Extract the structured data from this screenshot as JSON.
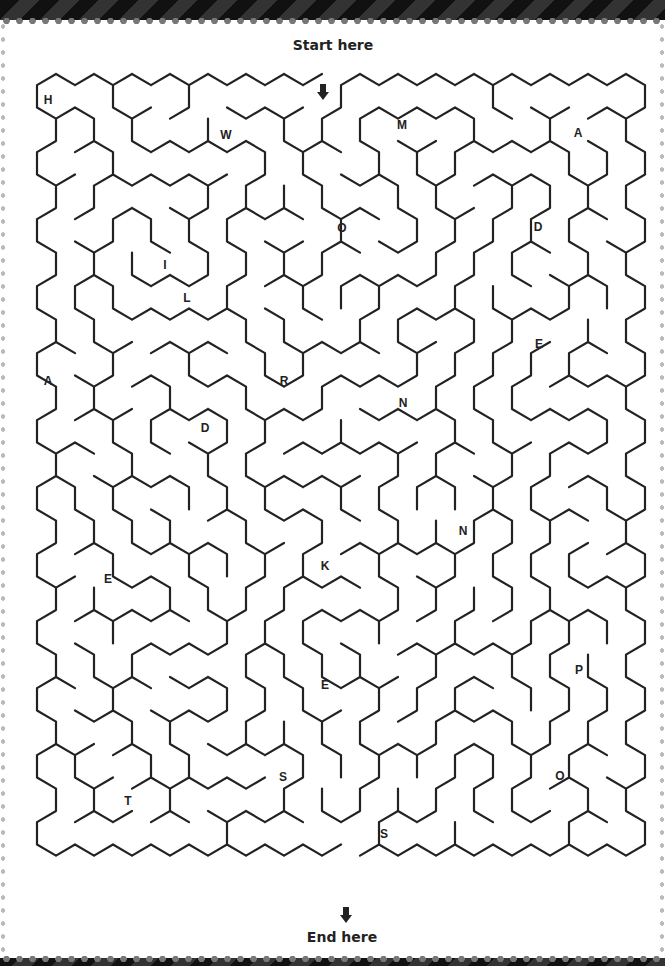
{
  "puzzle": {
    "start_label": "Start here",
    "end_label": "End here",
    "start_arrow_icon": "arrow-down-icon",
    "end_arrow_icon": "arrow-down-icon",
    "line_color": "#222222",
    "letters": [
      {
        "char": "H",
        "x": 48,
        "y": 100
      },
      {
        "char": "W",
        "x": 226,
        "y": 135
      },
      {
        "char": "M",
        "x": 402,
        "y": 125
      },
      {
        "char": "A",
        "x": 578,
        "y": 133
      },
      {
        "char": "O",
        "x": 342,
        "y": 228
      },
      {
        "char": "D",
        "x": 538,
        "y": 227
      },
      {
        "char": "I",
        "x": 165,
        "y": 265
      },
      {
        "char": "L",
        "x": 187,
        "y": 298
      },
      {
        "char": "E",
        "x": 539,
        "y": 344
      },
      {
        "char": "A",
        "x": 48,
        "y": 381
      },
      {
        "char": "R",
        "x": 284,
        "y": 381
      },
      {
        "char": "N",
        "x": 403,
        "y": 403
      },
      {
        "char": "D",
        "x": 205,
        "y": 428
      },
      {
        "char": "N",
        "x": 463,
        "y": 531
      },
      {
        "char": "K",
        "x": 325,
        "y": 566
      },
      {
        "char": "E",
        "x": 108,
        "y": 579
      },
      {
        "char": "P",
        "x": 579,
        "y": 670
      },
      {
        "char": "E",
        "x": 325,
        "y": 685
      },
      {
        "char": "S",
        "x": 283,
        "y": 777
      },
      {
        "char": "O",
        "x": 560,
        "y": 776
      },
      {
        "char": "T",
        "x": 128,
        "y": 801
      },
      {
        "char": "S",
        "x": 384,
        "y": 834
      }
    ]
  }
}
